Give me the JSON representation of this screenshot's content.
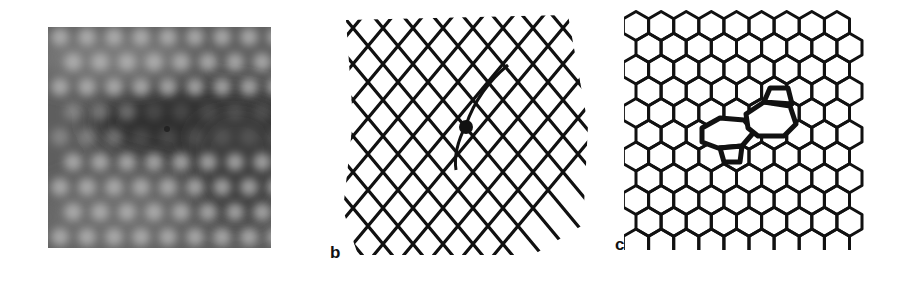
{
  "figure": {
    "panels": [
      {
        "id": "a",
        "label": "",
        "kind": "grayscale-micrograph",
        "description": "Grayscale image of a periodic lattice of bright spots with a darker band across the middle and a small dark marker near center",
        "colors": {
          "background_light": "#8a8a8a",
          "background_dark": "#3a3a3a",
          "spot": "#b8b8b8"
        }
      },
      {
        "id": "b",
        "label": "b",
        "kind": "line-drawing",
        "description": "Rhombic (diamond) lattice drawing with a dislocation core marked by a filled black dot",
        "colors": {
          "line": "#111111",
          "background": "#ffffff"
        }
      },
      {
        "id": "c",
        "label": "c",
        "kind": "line-drawing",
        "description": "Hexagonal (honeycomb) lattice with a pentagon-heptagon-heptagon-pentagon defect drawn with thicker lines",
        "colors": {
          "line": "#111111",
          "background": "#ffffff"
        }
      }
    ]
  }
}
